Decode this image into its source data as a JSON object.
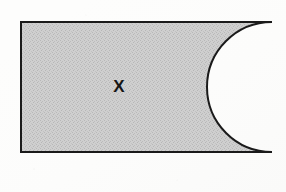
{
  "figure": {
    "type": "geometry-diagram",
    "label": "X",
    "label_position": {
      "x": 119,
      "y": 88
    },
    "background_color": "#fdfdfc",
    "fill_color": "#c8c8c8",
    "stroke_color": "#1a1a1a",
    "stroke_width": 2,
    "rectangle": {
      "left": 21,
      "top": 22,
      "right": 272,
      "bottom": 152,
      "width": 251,
      "height": 130
    },
    "notch": {
      "shape": "semicircle",
      "side": "right",
      "center_x": 272,
      "center_y": 87,
      "radius": 65,
      "depth": 67,
      "leftmost_x": 205
    }
  }
}
